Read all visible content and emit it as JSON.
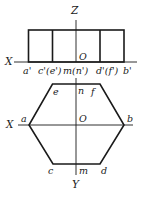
{
  "diagram": {
    "type": "orthographic-projection",
    "front_view": {
      "axis_labels": {
        "z": "Z",
        "x": "X",
        "origin": "O"
      },
      "point_labels": [
        "a'",
        "c'(e')",
        "m(n')",
        "d'(f')",
        "b'"
      ]
    },
    "top_view": {
      "axis_labels": {
        "x": "X",
        "y": "Y",
        "origin": "O"
      },
      "vertex_labels": {
        "a": "a",
        "b": "b",
        "c": "c",
        "d": "d",
        "e": "e",
        "f": "f",
        "m": "m",
        "n": "n"
      }
    },
    "colors": {
      "stroke": "#1a1a1a",
      "background": "#ffffff"
    }
  }
}
